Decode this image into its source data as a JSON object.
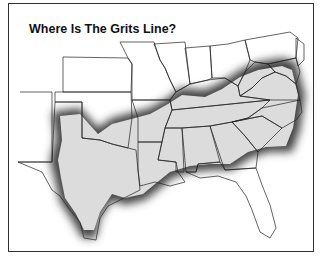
{
  "map": {
    "title": "Where Is The Grits Line?",
    "region_label": "Grits line region (shaded)",
    "colors": {
      "region_fill": "#dcdcdc",
      "region_border_glow": "#555555",
      "state_lines": "#222222",
      "frame": "#333333",
      "background": "#ffffff"
    },
    "shaded_states": [
      "Texas",
      "Oklahoma (southeast)",
      "Arkansas",
      "Louisiana",
      "Mississippi",
      "Alabama",
      "Georgia",
      "Tennessee",
      "South Carolina",
      "North Carolina",
      "Kentucky (south)",
      "Virginia (south)",
      "West Virginia (south)"
    ],
    "unshaded_states_visible": [
      "Florida",
      "Missouri",
      "Kansas",
      "Illinois",
      "Indiana",
      "Ohio",
      "Pennsylvania",
      "New Jersey",
      "Maryland",
      "Delaware",
      "New Mexico (edge)"
    ]
  }
}
